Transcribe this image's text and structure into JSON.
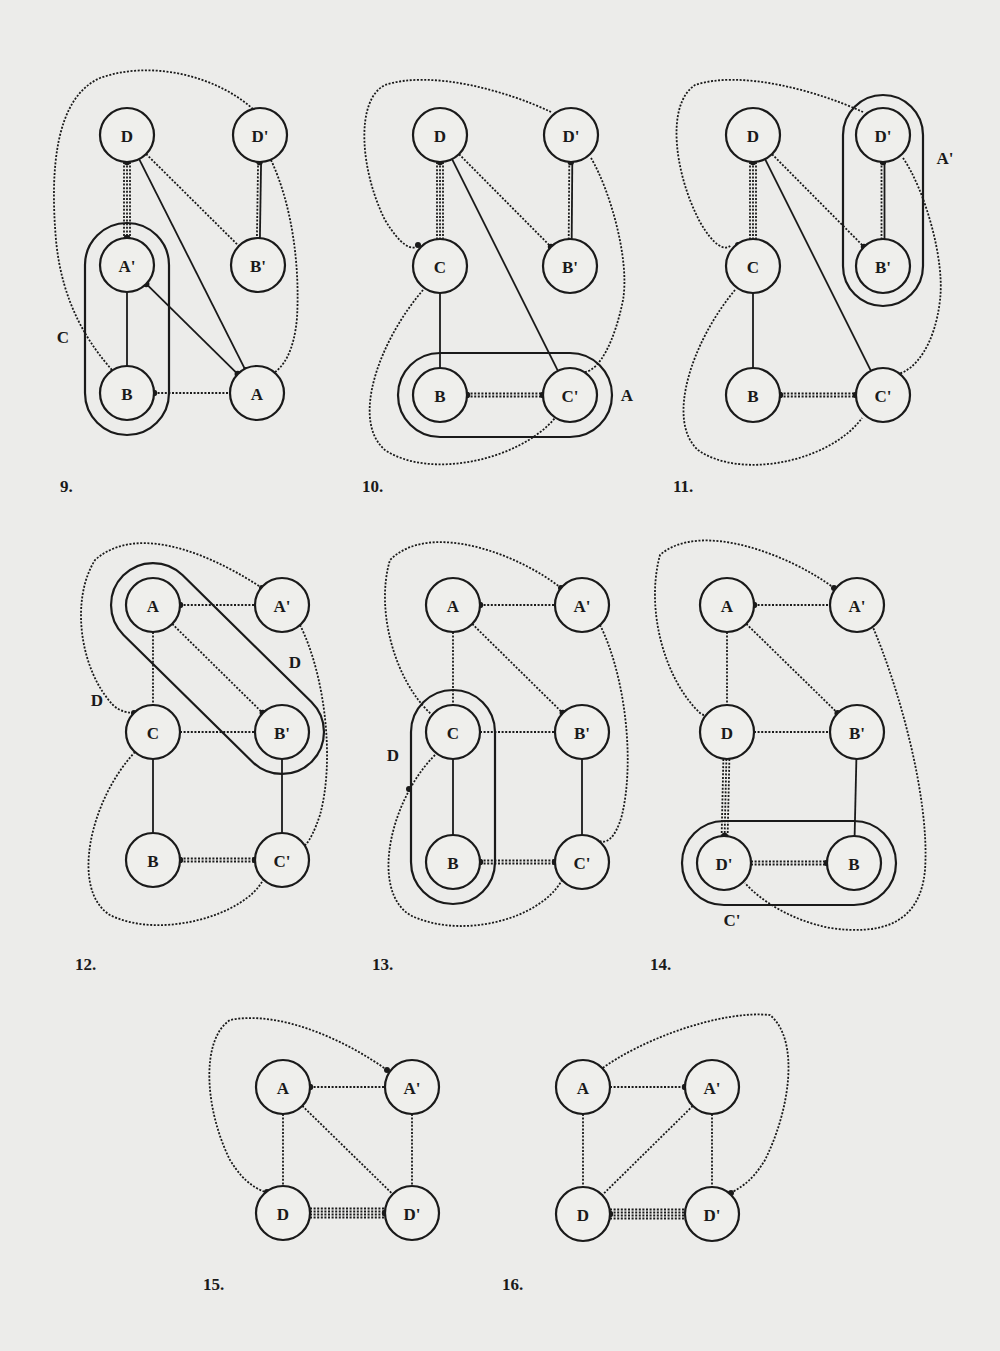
{
  "page": {
    "background": "#ececea",
    "ink": "#1a1a1a"
  },
  "figures": [
    {
      "id": "9",
      "number_label": "9.",
      "number_pos": [
        60,
        492
      ],
      "nodes": [
        {
          "id": "D",
          "label": "D",
          "x": 127,
          "y": 135
        },
        {
          "id": "Dp",
          "label": "D'",
          "x": 260,
          "y": 135
        },
        {
          "id": "Ap",
          "label": "A'",
          "x": 127,
          "y": 265
        },
        {
          "id": "Bp",
          "label": "B'",
          "x": 258,
          "y": 265
        },
        {
          "id": "B",
          "label": "B",
          "x": 127,
          "y": 393
        },
        {
          "id": "A",
          "label": "A",
          "x": 257,
          "y": 393
        }
      ],
      "edges": [
        {
          "from": "D",
          "to": "Ap",
          "style": "dotted",
          "count": 3,
          "dot": "both"
        },
        {
          "from": "D",
          "to": "A",
          "style": "solid",
          "count": 1
        },
        {
          "from": "D",
          "to": "Bp",
          "style": "dotted",
          "count": 1
        },
        {
          "from": "Dp",
          "to": "Bp",
          "style": "mixed-solid-dotted",
          "count": 2,
          "dot": "from"
        },
        {
          "from": "Ap",
          "to": "B",
          "style": "solid",
          "count": 1
        },
        {
          "from": "Ap",
          "to": "A",
          "style": "solid",
          "count": 1,
          "dot": "both"
        },
        {
          "from": "B",
          "to": "A",
          "style": "dotted",
          "count": 1,
          "dot": "from"
        }
      ],
      "capsules": [
        {
          "x1": 127,
          "y1": 265,
          "x2": 127,
          "y2": 393,
          "r": 42,
          "label": "C",
          "label_pos": [
            63,
            337
          ]
        }
      ],
      "blob": {
        "path": "M 260 108 C 230 70 170 60 110 80 C 60 100 50 170 58 240 C 64 300 90 340 110 372",
        "dot_end": false,
        "extra": "M 268 160 C 290 210 300 270 296 320 C 292 350 282 372 272 374"
      },
      "region_labels": []
    },
    {
      "id": "10",
      "number_label": "10.",
      "number_pos": [
        362,
        492
      ],
      "nodes": [
        {
          "id": "D",
          "label": "D",
          "x": 440,
          "y": 135
        },
        {
          "id": "Dp",
          "label": "D'",
          "x": 571,
          "y": 135
        },
        {
          "id": "C",
          "label": "C",
          "x": 440,
          "y": 266
        },
        {
          "id": "Bp",
          "label": "B'",
          "x": 570,
          "y": 266
        },
        {
          "id": "B",
          "label": "B",
          "x": 440,
          "y": 395
        },
        {
          "id": "Cp",
          "label": "C'",
          "x": 570,
          "y": 395
        }
      ],
      "edges": [
        {
          "from": "D",
          "to": "C",
          "style": "dotted",
          "count": 3,
          "dot": "from"
        },
        {
          "from": "D",
          "to": "Cp",
          "style": "solid",
          "count": 1
        },
        {
          "from": "D",
          "to": "Bp",
          "style": "dotted",
          "count": 1,
          "dot": "to"
        },
        {
          "from": "Dp",
          "to": "Bp",
          "style": "mixed-solid-dotted",
          "count": 2,
          "dot": "from"
        },
        {
          "from": "C",
          "to": "B",
          "style": "solid",
          "count": 1
        },
        {
          "from": "B",
          "to": "Cp",
          "style": "dotted",
          "count": 2,
          "dot": "both"
        }
      ],
      "capsules": [
        {
          "x1": 440,
          "y1": 395,
          "x2": 570,
          "y2": 395,
          "r": 42,
          "label": "A",
          "label_pos": [
            627,
            395
          ]
        }
      ],
      "region_labels": []
    },
    {
      "id": "11",
      "number_label": "11.",
      "number_pos": [
        673,
        492
      ],
      "nodes": [
        {
          "id": "D",
          "label": "D",
          "x": 753,
          "y": 135
        },
        {
          "id": "Dp",
          "label": "D'",
          "x": 883,
          "y": 135
        },
        {
          "id": "C",
          "label": "C",
          "x": 753,
          "y": 266
        },
        {
          "id": "Bp",
          "label": "B'",
          "x": 883,
          "y": 266
        },
        {
          "id": "B",
          "label": "B",
          "x": 753,
          "y": 395
        },
        {
          "id": "Cp",
          "label": "C'",
          "x": 883,
          "y": 395
        }
      ],
      "edges": [
        {
          "from": "D",
          "to": "C",
          "style": "dotted",
          "count": 3,
          "dot": "from"
        },
        {
          "from": "D",
          "to": "Cp",
          "style": "solid",
          "count": 1
        },
        {
          "from": "D",
          "to": "Bp",
          "style": "dotted",
          "count": 1,
          "dot": "to"
        },
        {
          "from": "Dp",
          "to": "Bp",
          "style": "mixed-solid-dotted",
          "count": 2,
          "dot": "from"
        },
        {
          "from": "C",
          "to": "B",
          "style": "solid",
          "count": 1
        },
        {
          "from": "B",
          "to": "Cp",
          "style": "dotted",
          "count": 2,
          "dot": "both"
        }
      ],
      "capsules": [
        {
          "x1": 883,
          "y1": 135,
          "x2": 883,
          "y2": 266,
          "r": 40,
          "label": "A'",
          "label_pos": [
            945,
            158
          ]
        }
      ],
      "region_labels": []
    },
    {
      "id": "12",
      "number_label": "12.",
      "number_pos": [
        75,
        970
      ],
      "nodes": [
        {
          "id": "A",
          "label": "A",
          "x": 153,
          "y": 605
        },
        {
          "id": "Ap",
          "label": "A'",
          "x": 282,
          "y": 605
        },
        {
          "id": "C",
          "label": "C",
          "x": 153,
          "y": 732
        },
        {
          "id": "Bp",
          "label": "B'",
          "x": 282,
          "y": 732
        },
        {
          "id": "B",
          "label": "B",
          "x": 153,
          "y": 860
        },
        {
          "id": "Cp",
          "label": "C'",
          "x": 282,
          "y": 860
        }
      ],
      "edges": [
        {
          "from": "A",
          "to": "Ap",
          "style": "dotted",
          "count": 1,
          "dot": "from"
        },
        {
          "from": "A",
          "to": "C",
          "style": "dotted",
          "count": 1
        },
        {
          "from": "A",
          "to": "Bp",
          "style": "dotted",
          "count": 1,
          "dot": "to"
        },
        {
          "from": "C",
          "to": "Bp",
          "style": "dotted",
          "count": 1
        },
        {
          "from": "C",
          "to": "B",
          "style": "solid",
          "count": 1
        },
        {
          "from": "Bp",
          "to": "Cp",
          "style": "solid",
          "count": 1
        },
        {
          "from": "B",
          "to": "Cp",
          "style": "dotted",
          "count": 2,
          "dot": "both"
        }
      ],
      "capsules": [
        {
          "x1": 153,
          "y1": 605,
          "x2": 282,
          "y2": 732,
          "r": 42,
          "label": "",
          "label_pos": [
            0,
            0
          ]
        }
      ],
      "region_labels": [
        {
          "text": "D",
          "x": 295,
          "y": 662
        },
        {
          "text": "D",
          "x": 97,
          "y": 700
        }
      ]
    },
    {
      "id": "13",
      "number_label": "13.",
      "number_pos": [
        372,
        970
      ],
      "nodes": [
        {
          "id": "A",
          "label": "A",
          "x": 453,
          "y": 605
        },
        {
          "id": "Ap",
          "label": "A'",
          "x": 582,
          "y": 605
        },
        {
          "id": "C",
          "label": "C",
          "x": 453,
          "y": 732
        },
        {
          "id": "Bp",
          "label": "B'",
          "x": 582,
          "y": 732
        },
        {
          "id": "B",
          "label": "B",
          "x": 453,
          "y": 862
        },
        {
          "id": "Cp",
          "label": "C'",
          "x": 582,
          "y": 862
        }
      ],
      "edges": [
        {
          "from": "A",
          "to": "Ap",
          "style": "dotted",
          "count": 1,
          "dot": "from"
        },
        {
          "from": "A",
          "to": "C",
          "style": "dotted",
          "count": 1
        },
        {
          "from": "A",
          "to": "Bp",
          "style": "dotted",
          "count": 1,
          "dot": "to"
        },
        {
          "from": "C",
          "to": "Bp",
          "style": "dotted",
          "count": 1
        },
        {
          "from": "C",
          "to": "B",
          "style": "solid",
          "count": 1
        },
        {
          "from": "Bp",
          "to": "Cp",
          "style": "solid",
          "count": 1
        },
        {
          "from": "B",
          "to": "Cp",
          "style": "dotted",
          "count": 2,
          "dot": "both"
        }
      ],
      "capsules": [
        {
          "x1": 453,
          "y1": 732,
          "x2": 453,
          "y2": 862,
          "r": 42,
          "label": "D",
          "label_pos": [
            393,
            755
          ]
        }
      ],
      "region_labels": []
    },
    {
      "id": "14",
      "number_label": "14.",
      "number_pos": [
        650,
        970
      ],
      "nodes": [
        {
          "id": "A",
          "label": "A",
          "x": 727,
          "y": 605
        },
        {
          "id": "Ap",
          "label": "A'",
          "x": 857,
          "y": 605
        },
        {
          "id": "D",
          "label": "D",
          "x": 727,
          "y": 732
        },
        {
          "id": "Bp",
          "label": "B'",
          "x": 857,
          "y": 732
        },
        {
          "id": "Dp",
          "label": "D'",
          "x": 724,
          "y": 863
        },
        {
          "id": "B",
          "label": "B",
          "x": 854,
          "y": 863
        }
      ],
      "edges": [
        {
          "from": "A",
          "to": "Ap",
          "style": "dotted",
          "count": 1,
          "dot": "from"
        },
        {
          "from": "A",
          "to": "D",
          "style": "dotted",
          "count": 1
        },
        {
          "from": "A",
          "to": "Bp",
          "style": "dotted",
          "count": 1,
          "dot": "to"
        },
        {
          "from": "D",
          "to": "Bp",
          "style": "dotted",
          "count": 1
        },
        {
          "from": "D",
          "to": "Dp",
          "style": "dotted",
          "count": 3,
          "dot": "to"
        },
        {
          "from": "Bp",
          "to": "B",
          "style": "solid",
          "count": 1
        },
        {
          "from": "Dp",
          "to": "B",
          "style": "dotted",
          "count": 2,
          "dot": "to"
        }
      ],
      "capsules": [
        {
          "x1": 724,
          "y1": 863,
          "x2": 854,
          "y2": 863,
          "r": 42,
          "label": "C'",
          "label_pos": [
            732,
            920
          ]
        }
      ],
      "region_labels": []
    },
    {
      "id": "15",
      "number_label": "15.",
      "number_pos": [
        203,
        1290
      ],
      "nodes": [
        {
          "id": "A",
          "label": "A",
          "x": 283,
          "y": 1087
        },
        {
          "id": "Ap",
          "label": "A'",
          "x": 412,
          "y": 1087
        },
        {
          "id": "D",
          "label": "D",
          "x": 283,
          "y": 1213
        },
        {
          "id": "Dp",
          "label": "D'",
          "x": 412,
          "y": 1213
        }
      ],
      "edges": [
        {
          "from": "A",
          "to": "Ap",
          "style": "dotted",
          "count": 1,
          "dot": "from"
        },
        {
          "from": "A",
          "to": "D",
          "style": "dotted",
          "count": 1
        },
        {
          "from": "A",
          "to": "Dp",
          "style": "dotted",
          "count": 1
        },
        {
          "from": "Ap",
          "to": "Dp",
          "style": "dotted",
          "count": 1
        },
        {
          "from": "D",
          "to": "Dp",
          "style": "dotted",
          "count": 4,
          "dot": "to"
        }
      ],
      "capsules": [],
      "region_labels": []
    },
    {
      "id": "16",
      "number_label": "16.",
      "number_pos": [
        502,
        1290
      ],
      "nodes": [
        {
          "id": "A",
          "label": "A",
          "x": 583,
          "y": 1087
        },
        {
          "id": "Ap",
          "label": "A'",
          "x": 712,
          "y": 1087
        },
        {
          "id": "D",
          "label": "D",
          "x": 583,
          "y": 1214
        },
        {
          "id": "Dp",
          "label": "D'",
          "x": 712,
          "y": 1214
        }
      ],
      "edges": [
        {
          "from": "A",
          "to": "Ap",
          "style": "dotted",
          "count": 1,
          "dot": "to"
        },
        {
          "from": "A",
          "to": "D",
          "style": "dotted",
          "count": 1
        },
        {
          "from": "Ap",
          "to": "D",
          "style": "dotted",
          "count": 1
        },
        {
          "from": "Ap",
          "to": "Dp",
          "style": "dotted",
          "count": 1
        },
        {
          "from": "D",
          "to": "Dp",
          "style": "dotted",
          "count": 4,
          "dot": "from"
        }
      ],
      "capsules": [],
      "region_labels": []
    }
  ],
  "outer_curves": [
    {
      "figure": "9",
      "d": "M 253 109 C 215 75 150 60 100 78 C 55 98 50 170 56 240 C 62 305 90 345 112 370",
      "dots": [
        [
          246,
          370
        ]
      ]
    },
    {
      "figure": "9",
      "d": "M 271 160 C 292 205 300 265 297 318 C 294 352 283 368 272 374",
      "dots": [
        [
          272,
          374
        ]
      ]
    },
    {
      "figure": "10",
      "d": "M 551 112 C 505 90 430 70 385 85 C 355 100 360 170 385 220 C 400 245 412 252 418 245",
      "dots": [
        [
          418,
          245
        ]
      ]
    },
    {
      "figure": "10",
      "d": "M 591 158 C 610 190 630 260 623 300 C 615 340 600 370 585 372",
      "dots": []
    },
    {
      "figure": "10",
      "d": "M 423 290 C 380 340 350 420 385 450 C 430 480 520 460 555 418",
      "dots": []
    },
    {
      "figure": "11",
      "d": "M 863 112 C 815 90 740 70 695 85 C 665 105 675 175 700 222 C 713 245 725 252 731 245",
      "dots": [
        [
          738,
          245
        ]
      ]
    },
    {
      "figure": "11",
      "d": "M 903 158 C 925 190 945 260 940 300 C 935 345 915 370 898 374",
      "dots": []
    },
    {
      "figure": "11",
      "d": "M 735 290 C 693 340 665 420 698 450 C 740 480 830 462 862 418",
      "dots": []
    },
    {
      "figure": "12",
      "d": "M 262 588 C 220 560 140 520 95 560 C 70 600 80 670 113 705 C 120 712 130 713 134 713",
      "dots": [
        [
          262,
          588
        ],
        [
          134,
          713
        ]
      ]
    },
    {
      "figure": "12",
      "d": "M 300 625 C 325 675 335 760 320 815 C 310 845 300 855 297 840",
      "dots": []
    },
    {
      "figure": "12",
      "d": "M 135 752 C 90 800 70 890 110 915 C 160 940 245 915 263 880",
      "dots": []
    },
    {
      "figure": "13",
      "d": "M 561 588 C 520 555 430 520 390 560 C 375 610 395 680 430 713 C 435 717 440 715 440 714",
      "dots": [
        [
          561,
          588
        ],
        [
          440,
          714
        ]
      ]
    },
    {
      "figure": "13",
      "d": "M 600 625 C 625 675 635 760 622 815 C 615 840 605 845 598 840",
      "dots": []
    },
    {
      "figure": "13",
      "d": "M 435 755 C 390 800 370 890 410 915 C 460 940 540 920 562 880",
      "dots": [
        [
          409,
          789
        ]
      ]
    },
    {
      "figure": "14",
      "d": "M 834 588 C 790 555 700 520 660 555 C 645 610 665 680 700 713 C 705 717 710 715 711 714",
      "dots": [
        [
          834,
          588
        ],
        [
          711,
          714
        ]
      ]
    },
    {
      "figure": "14",
      "d": "M 872 625 C 900 690 930 800 925 870 C 920 925 880 935 830 928 C 790 920 760 900 745 883",
      "dots": []
    },
    {
      "figure": "15",
      "d": "M 387 1070 C 345 1040 280 1010 230 1020 C 200 1040 205 1110 230 1160 C 245 1185 260 1190 265 1192",
      "dots": [
        [
          387,
          1070
        ],
        [
          267,
          1192
        ]
      ]
    },
    {
      "figure": "16",
      "d": "M 600 1070 C 640 1040 720 1010 770 1015 C 800 1040 790 1110 765 1160 C 750 1185 735 1190 731 1193",
      "dots": [
        [
          600,
          1070
        ],
        [
          731,
          1193
        ]
      ]
    }
  ]
}
